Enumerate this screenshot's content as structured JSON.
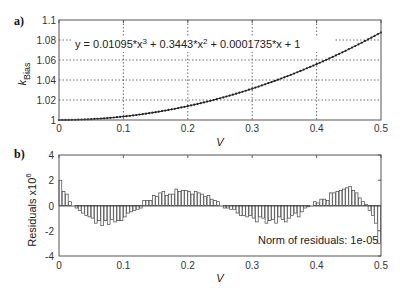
{
  "chart_data": [
    {
      "panel_label": "a)",
      "type": "line",
      "title": "",
      "xlabel": "V",
      "ylabel": "k",
      "ylabel_subscript": "Bias",
      "xlim": [
        0,
        0.5
      ],
      "ylim": [
        1,
        1.1
      ],
      "xticks": [
        0,
        0.1,
        0.2,
        0.3,
        0.4,
        0.5
      ],
      "xtick_labels": [
        "0",
        "0.1",
        "0.2",
        "0.3",
        "0.4",
        "0.5"
      ],
      "yticks": [
        1,
        1.02,
        1.04,
        1.06,
        1.08,
        1.1
      ],
      "ytick_labels": [
        "1",
        "1.02",
        "1.04",
        "1.06",
        "1.08",
        "1.1"
      ],
      "grid": true,
      "annotation": "y = 0.01095*x^3 + 0.3443*x^2 + 0.0001735*x + 1",
      "annotation_parts": {
        "prefix": "y = 0.01095*x",
        "exp1": "3",
        "mid": " + 0.3443*x",
        "exp2": "2",
        "suffix": " + 0.0001735*x + 1"
      },
      "fit": {
        "coefficients": [
          0.01095,
          0.3443,
          0.0001735,
          1
        ]
      },
      "series": [
        {
          "name": "data",
          "marker": "dot",
          "x_start": 0,
          "x_end": 0.5,
          "x_step": 0.005
        }
      ]
    },
    {
      "panel_label": "b)",
      "type": "bar",
      "title": "",
      "xlabel": "V",
      "ylabel": "Residuals x10",
      "ylabel_superscript": "6",
      "xlim": [
        0,
        0.5
      ],
      "ylim": [
        -4,
        4
      ],
      "xticks": [
        0,
        0.1,
        0.2,
        0.3,
        0.4,
        0.5
      ],
      "xtick_labels": [
        "0",
        "0.1",
        "0.2",
        "0.3",
        "0.4",
        "0.5"
      ],
      "yticks": [
        -4,
        -2,
        0,
        2,
        4
      ],
      "ytick_labels": [
        "-4",
        "-2",
        "0",
        "2",
        "4"
      ],
      "grid": false,
      "annotation": "Norm of residuals: 1e-05",
      "x_start": 0,
      "x_step": 0.005,
      "values": [
        2.0,
        1.1,
        0.9,
        0.3,
        0.0,
        -0.2,
        -0.4,
        -0.6,
        -0.8,
        -0.9,
        -1.0,
        -1.4,
        -1.2,
        -1.6,
        -1.2,
        -1.5,
        -1.1,
        -1.3,
        -1.2,
        -1.2,
        -0.9,
        -0.6,
        -0.5,
        -0.4,
        -0.3,
        -0.2,
        0.4,
        0.4,
        0.4,
        0.8,
        0.7,
        1.0,
        1.1,
        0.8,
        0.9,
        0.9,
        1.3,
        1.1,
        1.2,
        1.2,
        1.1,
        0.9,
        1.1,
        1.0,
        0.9,
        0.7,
        0.8,
        0.5,
        0.4,
        0.3,
        0.0,
        -0.2,
        -0.2,
        -0.3,
        -0.3,
        -0.6,
        -0.8,
        -0.8,
        -0.9,
        -0.8,
        -1.0,
        -1.3,
        -0.9,
        -1.0,
        -1.4,
        -1.2,
        -1.1,
        -1.4,
        -0.9,
        -1.1,
        -1.3,
        -1.0,
        -0.8,
        -0.6,
        -0.9,
        -0.5,
        -0.2,
        -0.1,
        0.0,
        0.3,
        0.2,
        0.5,
        0.5,
        0.4,
        1.0,
        1.0,
        1.1,
        1.2,
        1.3,
        1.4,
        1.5,
        1.2,
        1.0,
        0.6,
        0.3,
        0.1,
        -0.4,
        -0.8,
        -1.4,
        -3.0
      ]
    }
  ]
}
